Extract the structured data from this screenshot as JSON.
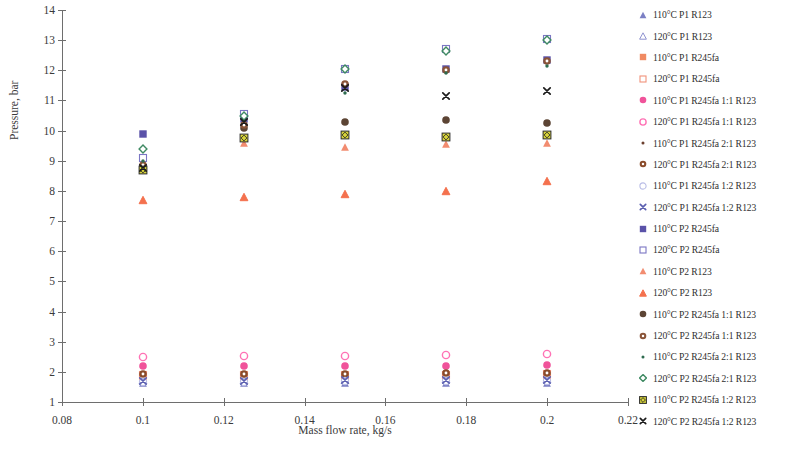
{
  "chart_data": {
    "type": "scatter",
    "title": "",
    "xlabel": "Mass flow rate, kg/s",
    "ylabel": "Pressure, bar",
    "xlim": [
      0.08,
      0.22
    ],
    "ylim": [
      1,
      14
    ],
    "xticks": [
      "0.08",
      "0.1",
      "0.12",
      "0.14",
      "0.16",
      "0.18",
      "0.2",
      "0.22"
    ],
    "xtick_values": [
      0.08,
      0.1,
      0.12,
      0.14,
      0.16,
      0.18,
      0.2,
      0.22
    ],
    "yticks": [
      "1",
      "2",
      "3",
      "4",
      "5",
      "6",
      "7",
      "8",
      "9",
      "10",
      "11",
      "12",
      "13",
      "14"
    ],
    "ytick_values": [
      1,
      2,
      3,
      4,
      5,
      6,
      7,
      8,
      9,
      10,
      11,
      12,
      13,
      14
    ],
    "grid": false,
    "legend_position": "right",
    "x": [
      0.1,
      0.125,
      0.15,
      0.175,
      0.2
    ],
    "series": [
      {
        "name": "110°C P1 R123",
        "marker": "triangle-filled",
        "color": "#7b7fc4",
        "values": [
          1.62,
          1.62,
          1.62,
          1.63,
          1.64
        ]
      },
      {
        "name": "120°C P1 R123",
        "marker": "triangle-open",
        "color": "#8f93d0",
        "values": [
          1.72,
          1.73,
          1.74,
          1.75,
          1.76
        ]
      },
      {
        "name": "110°C P1 R245fa",
        "marker": "square-filled",
        "color": "#f08a62",
        "values": [
          1.8,
          1.81,
          1.82,
          1.83,
          1.84
        ]
      },
      {
        "name": "120°C P1 R245fa",
        "marker": "square-open",
        "color": "#f0927a",
        "values": [
          1.88,
          1.89,
          1.9,
          1.91,
          1.92
        ]
      },
      {
        "name": "110°C P1 R245fa 1:1 R123",
        "marker": "circle-filled",
        "color": "#f0539a",
        "values": [
          2.18,
          2.19,
          2.2,
          2.21,
          2.22
        ]
      },
      {
        "name": "120°C P1 R245fa 1:1 R123",
        "marker": "circle-open",
        "color": "#ff72b5",
        "values": [
          2.5,
          2.52,
          2.54,
          2.56,
          2.58
        ]
      },
      {
        "name": "110°C P1 R245fa 2:1 R123",
        "marker": "dot-small",
        "color": "#6b3f2e",
        "values": [
          1.74,
          1.75,
          1.76,
          1.77,
          1.78
        ]
      },
      {
        "name": "120°C P1 R245fa 2:1 R123",
        "marker": "circle-target",
        "color": "#8a4b2a",
        "values": [
          1.92,
          1.93,
          1.94,
          1.95,
          1.96
        ]
      },
      {
        "name": "110°C P1 R245fa 1:2 R123",
        "marker": "circle-open-pale",
        "color": "#b9bde6",
        "values": [
          1.66,
          1.67,
          1.68,
          1.69,
          1.7
        ]
      },
      {
        "name": "120°C P1 R245fa 1:2 R123",
        "marker": "x-cross",
        "color": "#5b5fb0",
        "values": [
          1.7,
          1.71,
          1.72,
          1.73,
          1.74
        ]
      },
      {
        "name": "110°C P2 R245fa",
        "marker": "square-filled",
        "color": "#5a52a8",
        "values": [
          9.9,
          10.4,
          11.45,
          12.05,
          12.35
        ]
      },
      {
        "name": "120°C P2 R245fa",
        "marker": "square-open",
        "color": "#7b76c4",
        "values": [
          9.1,
          10.55,
          12.05,
          12.7,
          13.05
        ]
      },
      {
        "name": "110°C P2 R123",
        "marker": "triangle-filled",
        "color": "#f28c70",
        "values": [
          8.8,
          9.6,
          9.45,
          9.55,
          9.6
        ]
      },
      {
        "name": "120°C P2 R123",
        "marker": "triangle-open-filled",
        "color": "#f4714e",
        "values": [
          7.7,
          7.8,
          7.9,
          8.0,
          8.32
        ]
      },
      {
        "name": "110°C P2 R245fa 1:1 R123",
        "marker": "circle-filled",
        "color": "#5c4434",
        "values": [
          8.7,
          10.1,
          10.3,
          10.35,
          10.25
        ]
      },
      {
        "name": "120°C P2 R245fa 1:1 R123",
        "marker": "circle-target",
        "color": "#8a5438",
        "values": [
          8.85,
          10.2,
          11.55,
          12.0,
          12.3
        ]
      },
      {
        "name": "110°C P2 R245fa 2:1 R123",
        "marker": "dot-small",
        "color": "#2e6b4f",
        "values": [
          9.0,
          10.35,
          11.25,
          11.9,
          12.15
        ]
      },
      {
        "name": "120°C P2 R245fa 2:1 R123",
        "marker": "diamond-open",
        "color": "#3f8a63",
        "values": [
          9.4,
          10.5,
          12.05,
          12.65,
          13.0
        ]
      },
      {
        "name": "110°C P2 R245fa 1:2 R123",
        "marker": "square-yellow",
        "color": "#d8d438",
        "values": [
          8.7,
          9.75,
          9.85,
          9.8,
          9.85
        ]
      },
      {
        "name": "120°C P2 R245fa 1:2 R123",
        "marker": "x-cross",
        "color": "#1b1b1b",
        "values": [
          8.75,
          10.3,
          11.4,
          11.15,
          11.3
        ]
      }
    ]
  }
}
